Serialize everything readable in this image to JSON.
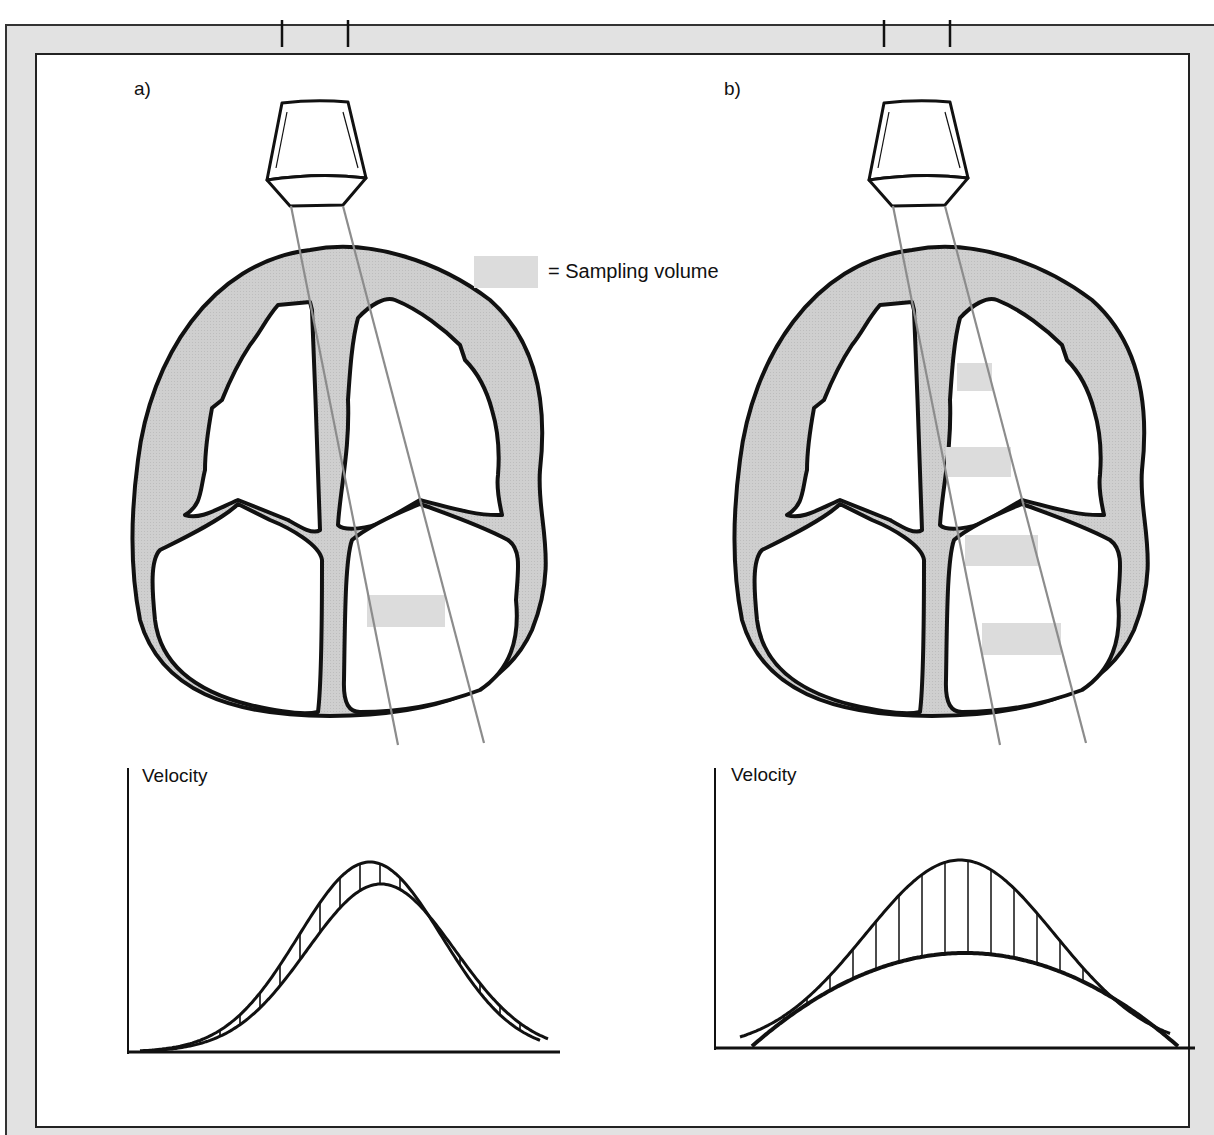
{
  "panels": [
    {
      "id": "a",
      "label": "a)",
      "sample_volume_count": 1,
      "plot": {
        "ylabel": "Velocity",
        "spectrum": "narrow",
        "description": "narrow band velocity spectrum from single sampling volume"
      }
    },
    {
      "id": "b",
      "label": "b)",
      "sample_volume_count": 4,
      "plot": {
        "ylabel": "Velocity",
        "spectrum": "broad",
        "description": "broad band velocity spectrum from multiple sampling volumes"
      }
    }
  ],
  "legend": {
    "symbol": "shaded-rectangle",
    "text": "= Sampling volume"
  },
  "colors": {
    "tissue_fill": "#cfcfcf",
    "sample_volume_fill": "#dcdcdc",
    "beam_line": "#8c8c8c",
    "outline": "#111111",
    "frame_fill": "#e2e2e2"
  }
}
